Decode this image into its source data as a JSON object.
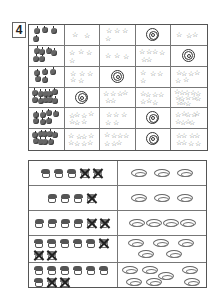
{
  "exercise_number": "4",
  "top_grid": {
    "columns": 5,
    "rows": [
      {
        "apples": 4,
        "cells": [
          {
            "type": "stars",
            "count": 2
          },
          {
            "type": "stars",
            "count": 4
          },
          {
            "type": "target"
          },
          {
            "type": "stars",
            "count": 3
          }
        ]
      },
      {
        "apples": 6,
        "cells": [
          {
            "type": "stars",
            "count": 4
          },
          {
            "type": "stars",
            "count": 3
          },
          {
            "type": "stars",
            "count": 6
          },
          {
            "type": "target"
          }
        ]
      },
      {
        "apples": 5,
        "cells": [
          {
            "type": "stars",
            "count": 5
          },
          {
            "type": "target"
          },
          {
            "type": "stars",
            "count": 4
          },
          {
            "type": "stars",
            "count": 6
          }
        ]
      },
      {
        "apples": 10,
        "cells": [
          {
            "type": "target"
          },
          {
            "type": "stars",
            "count": 6
          },
          {
            "type": "stars",
            "count": 7
          },
          {
            "type": "stars",
            "count": 13
          }
        ]
      },
      {
        "apples": 7,
        "cells": [
          {
            "type": "stars",
            "count": 7
          },
          {
            "type": "stars",
            "count": 5
          },
          {
            "type": "target"
          },
          {
            "type": "stars",
            "count": 9
          }
        ]
      },
      {
        "apples": 9,
        "cells": [
          {
            "type": "stars",
            "count": 8
          },
          {
            "type": "stars",
            "count": 7
          },
          {
            "type": "target"
          },
          {
            "type": "stars",
            "count": 8
          }
        ]
      }
    ]
  },
  "bottom_grid": {
    "rows": [
      {
        "cakes": 5,
        "crossed": 2,
        "plates": 3
      },
      {
        "cakes": 4,
        "crossed": 1,
        "plates": 3
      },
      {
        "cakes": 6,
        "crossed": 2,
        "plates": 4
      },
      {
        "cakes": 8,
        "crossed": 3,
        "plates": 5
      },
      {
        "cakes": 9,
        "crossed": 2,
        "plates": 7
      }
    ]
  }
}
